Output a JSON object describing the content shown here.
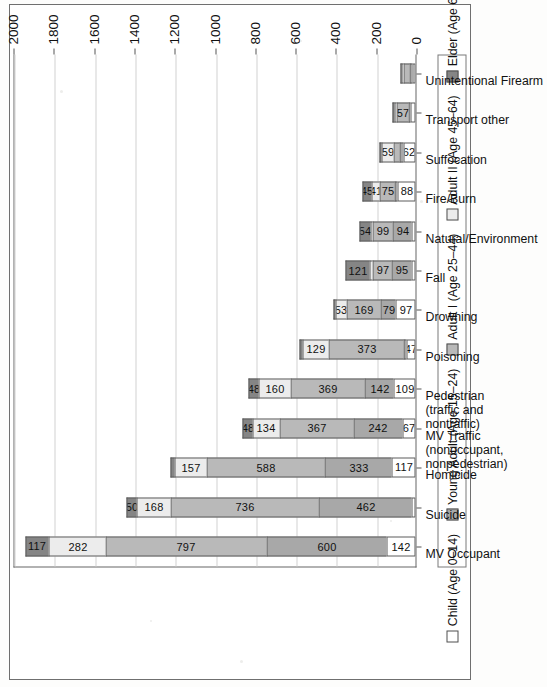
{
  "chart_data": {
    "type": "bar",
    "subtype": "stacked-bar",
    "orientation": "vertical-rotated-90",
    "title": "",
    "xlabel": "",
    "ylabel": "Numbers of Deaths",
    "ylim": [
      0,
      2000
    ],
    "ytick_step": 200,
    "yticks": [
      "0",
      "200",
      "400",
      "600",
      "800",
      "1000",
      "1200",
      "1400",
      "1600",
      "1800",
      "2000"
    ],
    "grid": "horizontal",
    "legend_position": "bottom",
    "categories": [
      "MV Occupant",
      "Suicide",
      "Homicide",
      "MV Traffic (nonoccupant, nonpedestrian)",
      "Pedestrian (traffic and nontraffic)",
      "Poisoning",
      "Drowning",
      "Fall",
      "Natural/Environment",
      "Fire/Burn",
      "Suffocation",
      "Transport other",
      "Unintentional Firearm"
    ],
    "series": [
      {
        "name": "Child (Age 0-14)",
        "legend_label": "Child (Age 0–14)",
        "color": "#ffffff",
        "values": [
          142,
          18,
          117,
          67,
          109,
          47,
          97,
          22,
          20,
          88,
          62,
          24,
          14
        ]
      },
      {
        "name": "Young Adult (Age 15-24)",
        "legend_label": "Young Adult (Age 15–24)",
        "color": "#a8a8a8",
        "values": [
          600,
          462,
          333,
          242,
          142,
          12,
          79,
          95,
          94,
          16,
          18,
          11,
          17
        ]
      },
      {
        "name": "Adult I (Age 25-44)",
        "legend_label": "Adult I (Age 25–44)",
        "color": "#b9b9b9",
        "values": [
          797,
          736,
          588,
          367,
          369,
          373,
          169,
          97,
          99,
          75,
          30,
          57,
          28
        ]
      },
      {
        "name": "Adult II (Age 45-64)",
        "legend_label": "Adult II (Age 45–64)",
        "color": "#ececec",
        "values": [
          282,
          168,
          157,
          134,
          160,
          129,
          53,
          14,
          13,
          41,
          59,
          12,
          10
        ]
      },
      {
        "name": "Elder (Age 65+)",
        "legend_label": "Elder (Age 65+)",
        "color": "#858585",
        "values": [
          117,
          50,
          22,
          48,
          48,
          14,
          9,
          121,
          54,
          45,
          11,
          10,
          8
        ]
      }
    ],
    "labeled_values": {
      "MV Occupant": [
        "142",
        "600",
        "797",
        "282",
        "117"
      ],
      "Suicide": [
        "",
        "462",
        "736",
        "168",
        "50"
      ],
      "Homicide": [
        "117",
        "333",
        "588",
        "157",
        ""
      ],
      "MV Traffic (nonoccupant, nonpedestrian)": [
        "67",
        "242",
        "367",
        "134",
        "48"
      ],
      "Pedestrian (traffic and nontraffic)": [
        "109",
        "142",
        "369",
        "160",
        "48"
      ],
      "Poisoning": [
        "47",
        "",
        "373",
        "129",
        ""
      ],
      "Drowning": [
        "97",
        "79",
        "169",
        "53",
        ""
      ],
      "Fall": [
        "",
        "95",
        "97",
        "",
        "121"
      ],
      "Natural/Environment": [
        "",
        "94",
        "99",
        "",
        "54"
      ],
      "Fire/Burn": [
        "88",
        "",
        "75",
        "41",
        "45"
      ],
      "Suffocation": [
        "62",
        "",
        "",
        "59",
        ""
      ],
      "Transport other": [
        "",
        "",
        "57",
        "",
        ""
      ],
      "Unintentional Firearm": [
        "",
        "",
        "",
        "",
        ""
      ]
    }
  },
  "axis": {
    "y_title": "Numbers of Deaths"
  }
}
